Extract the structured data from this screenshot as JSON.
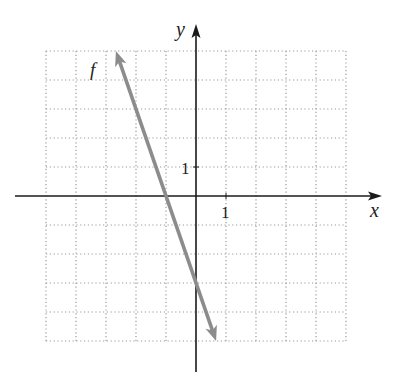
{
  "chart_data": {
    "type": "line",
    "title": "",
    "xlabel": "x",
    "ylabel": "y",
    "xlim": [
      -5,
      5
    ],
    "ylim": [
      -5,
      5
    ],
    "grid": true,
    "grid_style": "dotted",
    "tick_labels": {
      "x": [
        "1"
      ],
      "y": [
        "1"
      ]
    },
    "series": [
      {
        "name": "f",
        "equation": "f(x) = -3x - 3",
        "slope": -3,
        "intercept": -3,
        "x": [
          -2.67,
          -1,
          0,
          0.67
        ],
        "y": [
          5,
          0,
          -3,
          -5
        ],
        "arrows_both_ends": true,
        "color": "#8c8c8c"
      }
    ],
    "annotations": [
      {
        "text": "f",
        "x": -3.7,
        "y": 4.6
      }
    ]
  },
  "labels": {
    "x_axis": "x",
    "y_axis": "y",
    "x_tick": "1",
    "y_tick": "1",
    "function_name": "f"
  },
  "colors": {
    "axis": "#1a1a1a",
    "grid": "#9a9a9a",
    "line": "#8c8c8c",
    "function_label": "#9a9a9a"
  }
}
